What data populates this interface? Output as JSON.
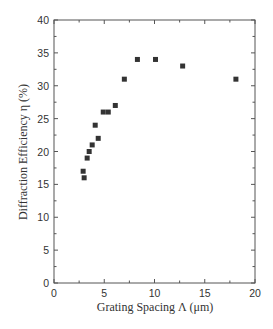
{
  "chart_data": {
    "type": "scatter",
    "title": "",
    "xlabel": "Grating Spacing  Λ (μm)",
    "ylabel": "Diffraction Efficiency η (%)",
    "xlim": [
      0,
      20
    ],
    "ylim": [
      0,
      40
    ],
    "x_ticks": [
      0,
      5,
      10,
      15,
      20
    ],
    "y_ticks": [
      0,
      5,
      10,
      15,
      20,
      25,
      30,
      35,
      40
    ],
    "grid": false,
    "legend": null,
    "marker": "square",
    "marker_color": "#333333",
    "series": [
      {
        "name": "Diffraction Efficiency",
        "x": [
          2.9,
          3.0,
          3.3,
          3.5,
          3.8,
          4.1,
          4.4,
          4.9,
          5.4,
          6.1,
          7.0,
          8.3,
          10.1,
          12.8,
          18.1
        ],
        "y": [
          17,
          16,
          19,
          20,
          21,
          24,
          22,
          26,
          26,
          27,
          31,
          34,
          34,
          33,
          31
        ]
      }
    ]
  }
}
